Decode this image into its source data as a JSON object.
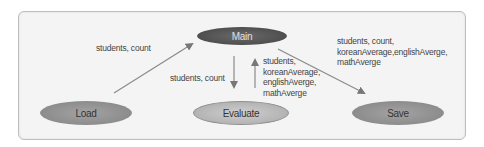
{
  "diagram": {
    "nodes": {
      "main": "Main",
      "load": "Load",
      "evaluate": "Evaluate",
      "save": "Save"
    },
    "edges": [
      {
        "from": "Load",
        "to": "Main",
        "label": "students, count"
      },
      {
        "from": "Main",
        "to": "Evaluate",
        "label": "students, count"
      },
      {
        "from": "Evaluate",
        "to": "Main",
        "label": "students,\nkoreanAverage,\nenglishAverge,\nmathAverge"
      },
      {
        "from": "Main",
        "to": "Save",
        "label": "students, count,\nkoreanAverage,englishAverge,\nmathAverge"
      }
    ]
  }
}
